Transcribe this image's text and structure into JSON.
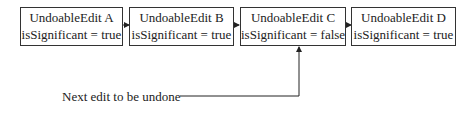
{
  "diagram": {
    "edits": [
      {
        "name": "UndoableEdit A",
        "flag": "isSignificant = true"
      },
      {
        "name": "UndoableEdit B",
        "flag": "isSignificant = true"
      },
      {
        "name": "UndoableEdit C",
        "flag": "isSignificant = false"
      },
      {
        "name": "UndoableEdit D",
        "flag": "isSignificant = true"
      }
    ],
    "pointer_label": "Next edit to be undone",
    "pointer_target": "UndoableEdit C"
  }
}
